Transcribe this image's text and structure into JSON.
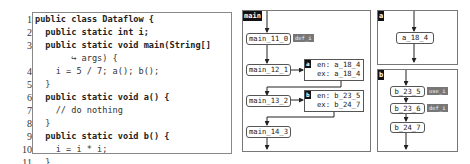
{
  "code": {
    "line_numbers": [
      "1",
      "2",
      "3",
      "",
      "4",
      "5",
      "6",
      "7",
      "8",
      "9",
      "10",
      "11",
      "12"
    ],
    "lines": [
      "public class Dataflow {",
      "  public static int i;",
      "  public static void main(String[]",
      "       ↪ args) {",
      "    i = 5 / 7; a(); b();",
      "  }",
      "  public static void a() {",
      "    // do nothing",
      "  }",
      "  public static void b() {",
      "    i = i * i;",
      "  }",
      "}"
    ]
  },
  "graph": {
    "main": {
      "label": "main",
      "nodes": [
        "main_11_0",
        "main_12_1",
        "main_13_2",
        "main_14_3"
      ],
      "badges": {
        "main_11_0": "def_i"
      },
      "calls": [
        {
          "tag": "a",
          "en": "en: a_18_4",
          "ex": "ex: a_18_4"
        },
        {
          "tag": "b",
          "en": "en: b_23_5",
          "ex": "ex: b_24_7"
        }
      ]
    },
    "a": {
      "label": "a",
      "nodes": [
        "a_18_4"
      ]
    },
    "b": {
      "label": "b",
      "nodes": [
        "b_23_5",
        "b_23_6",
        "b_24_7"
      ],
      "badges": {
        "b_23_5": "use_i",
        "b_23_6": "def_i"
      }
    }
  }
}
